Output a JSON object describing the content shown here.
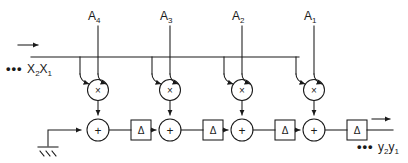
{
  "diagram": {
    "stroke_color": "#1a1a1a",
    "background_color": "#ffffff",
    "coefficient_taps": [
      {
        "label": "A",
        "subscript": "4",
        "x": 98
      },
      {
        "label": "A",
        "subscript": "3",
        "x": 170
      },
      {
        "label": "A",
        "subscript": "2",
        "x": 242
      },
      {
        "label": "A",
        "subscript": "1",
        "x": 314
      }
    ],
    "input": {
      "dots": "•••",
      "stream_label": "X",
      "sub_a": "2",
      "stream_label_2": "X",
      "sub_b": "1",
      "arrow": "→"
    },
    "output": {
      "dots": "•••",
      "stream_label": "y",
      "sub_a": "2",
      "stream_label_2": "y",
      "sub_b": "1",
      "arrow": "→"
    },
    "multiplier_glyph": "×",
    "adder_glyph": "+",
    "delay_glyph": "Δ",
    "multipliers": [
      {
        "x": 98,
        "y": 90
      },
      {
        "x": 170,
        "y": 90
      },
      {
        "x": 242,
        "y": 90
      },
      {
        "x": 314,
        "y": 90
      }
    ],
    "adders": [
      {
        "x": 78,
        "y": 130
      },
      {
        "x": 150,
        "y": 130
      },
      {
        "x": 222,
        "y": 130
      },
      {
        "x": 294,
        "y": 130
      }
    ],
    "delays": [
      {
        "x": 120,
        "y": 130
      },
      {
        "x": 192,
        "y": 130
      },
      {
        "x": 264,
        "y": 130
      },
      {
        "x": 336,
        "y": 130
      }
    ],
    "ground": {
      "x": 48,
      "y": 152
    },
    "bus_y": 57,
    "signal_y": 130
  }
}
